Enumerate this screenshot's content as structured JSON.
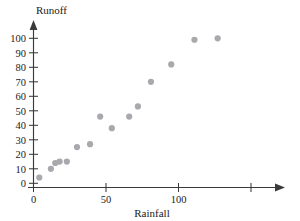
{
  "chart_data": {
    "type": "scatter",
    "title": "",
    "xlabel": "Rainfall",
    "ylabel": "Runoff",
    "xlim": [
      0,
      160
    ],
    "ylim": [
      0,
      108
    ],
    "grid": false,
    "legend": null,
    "xticks": [
      0,
      50,
      100,
      150
    ],
    "xtick_labels": [
      "0",
      "50",
      "100",
      ""
    ],
    "yticks": [
      10,
      20,
      30,
      40,
      50,
      60,
      70,
      80,
      90,
      100
    ],
    "ytick_labels": [
      "10",
      "20",
      "30",
      "40",
      "50",
      "60",
      "70",
      "80",
      "90",
      "100"
    ],
    "marker": "circle",
    "marker_color": "#a8a8ad",
    "marker_size": 3.1,
    "points": [
      {
        "x": 4,
        "y": 4
      },
      {
        "x": 12,
        "y": 10
      },
      {
        "x": 15,
        "y": 14
      },
      {
        "x": 18,
        "y": 15
      },
      {
        "x": 23,
        "y": 15
      },
      {
        "x": 30,
        "y": 25
      },
      {
        "x": 39,
        "y": 27
      },
      {
        "x": 46,
        "y": 46
      },
      {
        "x": 54,
        "y": 38
      },
      {
        "x": 66,
        "y": 46
      },
      {
        "x": 72,
        "y": 53
      },
      {
        "x": 81,
        "y": 70
      },
      {
        "x": 95,
        "y": 82
      },
      {
        "x": 111,
        "y": 99
      },
      {
        "x": 127,
        "y": 100
      }
    ]
  },
  "labels": {
    "y_axis_title": "Runoff",
    "x_axis_title": "Rainfall"
  },
  "axis_ticks": {
    "x": [
      "0",
      "50",
      "100"
    ],
    "y": [
      "100",
      "90",
      "80",
      "70",
      "60",
      "50",
      "40",
      "30",
      "20",
      "10",
      "0"
    ]
  },
  "colors": {
    "axis": "#3a3a3a",
    "marker": "#a8a8ad",
    "text": "#1a1a1a",
    "background": "#ffffff"
  }
}
